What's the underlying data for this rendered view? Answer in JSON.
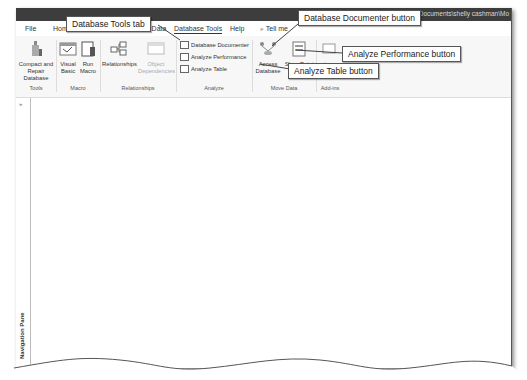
{
  "window": {
    "title": "CMF Vets : Database- C:\\Users\\mpokel\\Documents\\shelly cashman\\Mo"
  },
  "tabs": [
    {
      "label": "File",
      "active": false
    },
    {
      "label": "Home",
      "active": false
    },
    {
      "label": "Create",
      "active": false
    },
    {
      "label": "External Data",
      "active": false
    },
    {
      "label": "Database Tools",
      "active": true
    },
    {
      "label": "Help",
      "active": false
    },
    {
      "label": "Tell me",
      "active": false
    }
  ],
  "ribbon": {
    "groups": {
      "tools": {
        "label": "Tools",
        "compact_repair": "Compact and Repair Database"
      },
      "macro": {
        "label": "Macro",
        "visual_basic_1": "Visual",
        "visual_basic_2": "Basic",
        "run_macro_1": "Run",
        "run_macro_2": "Macro"
      },
      "relationships": {
        "label": "Relationships",
        "relationships": "Relationships",
        "object_dependencies_1": "Object",
        "object_dependencies_2": "Dependencies"
      },
      "analyze": {
        "label": "Analyze",
        "database_documenter": "Database Documenter",
        "analyze_performance": "Analyze Performance",
        "analyze_table": "Analyze Table"
      },
      "move_data": {
        "label": "Move Data",
        "access_database_1": "Access",
        "access_database_2": "Database",
        "sharepoint": "SharePoint"
      },
      "add_ins": {
        "label": "Add-ins",
        "add_ins_button": "ins"
      }
    }
  },
  "nav_pane": {
    "label": "Navigation Pane",
    "toggle": "»"
  },
  "callouts": {
    "database_tools_tab": "Database Tools tab",
    "database_documenter": "Database Documenter button",
    "analyze_performance": "Analyze Performance button",
    "analyze_table": "Analyze Table button"
  }
}
